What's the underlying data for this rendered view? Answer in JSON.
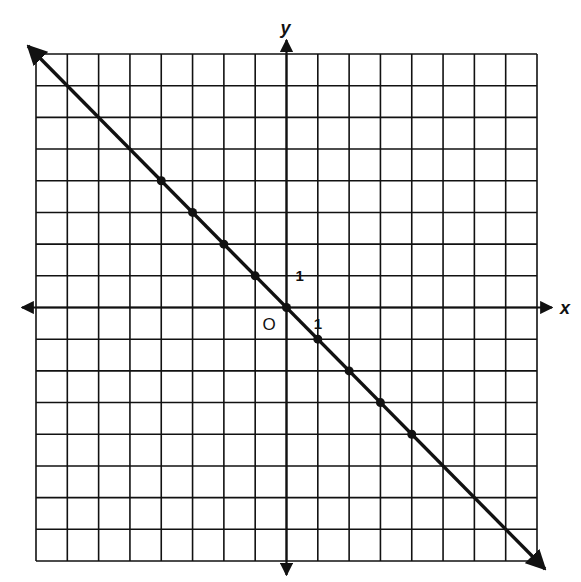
{
  "chart_data": {
    "type": "line",
    "title": "",
    "xlabel": "x",
    "ylabel": "y",
    "origin_label": "O",
    "x_tick_label": "1",
    "y_tick_label": "1",
    "xlim": [
      -8,
      8
    ],
    "ylim": [
      -8,
      8
    ],
    "grid": true,
    "equation": "y = -x",
    "series": [
      {
        "name": "line",
        "points": [
          {
            "x": -4,
            "y": 4
          },
          {
            "x": -3,
            "y": 3
          },
          {
            "x": -2,
            "y": 2
          },
          {
            "x": -1,
            "y": 1
          },
          {
            "x": 0,
            "y": 0
          },
          {
            "x": 1,
            "y": -1
          },
          {
            "x": 2,
            "y": -2
          },
          {
            "x": 3,
            "y": -3
          },
          {
            "x": 4,
            "y": -4
          }
        ],
        "extends_to": [
          {
            "x": -8,
            "y": 8
          },
          {
            "x": 8,
            "y": -8
          }
        ]
      }
    ],
    "colors": {
      "ink": "#111111",
      "background": "#ffffff"
    }
  }
}
